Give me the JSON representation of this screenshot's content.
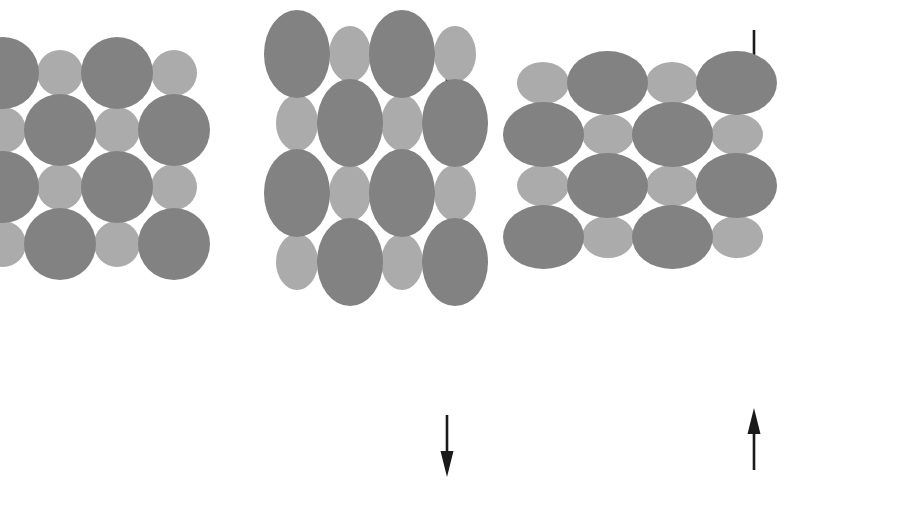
{
  "figure": {
    "width": 916,
    "height": 510,
    "background_color": "#ffffff",
    "description": "Three square arrays of alternating large dark grey and small light grey spheres. The left array is undeformed. The middle array is elongated vertically by a pair of outward arrows. The right array is flattened vertically by a pair of inward arrows."
  },
  "colors": {
    "large_particle": "#828282",
    "small_particle": "#ababab",
    "arrow": "#1a1a1a",
    "background": "#ffffff"
  },
  "geometry": {
    "large_radius": 36,
    "small_radius": 23,
    "step_x": 57,
    "step_y": 57,
    "columns": 4,
    "rows": 4
  },
  "panels": [
    {
      "id": "panel-unstressed",
      "name": "unstressed-lattice",
      "label": "Unstressed lattice",
      "origin_x": 88,
      "origin_y": 158,
      "scale_x": 1.0,
      "scale_y": 1.0,
      "parity": 0,
      "arrows": []
    },
    {
      "id": "panel-tension",
      "name": "tension-lattice",
      "label": "Lattice in tension",
      "origin_x": 376,
      "origin_y": 158,
      "scale_x": 0.92,
      "scale_y": 1.22,
      "parity": 0,
      "arrows": [
        {
          "name": "tension-arrow-top",
          "direction": "up",
          "x": 447,
          "y": 33,
          "length": 62,
          "label": "Tensile load, upward"
        },
        {
          "name": "tension-arrow-bottom",
          "direction": "down",
          "x": 447,
          "y": 415,
          "length": 62,
          "label": "Tensile load, downward"
        }
      ]
    },
    {
      "id": "panel-compression",
      "name": "compression-lattice",
      "label": "Lattice in compression",
      "origin_x": 640,
      "origin_y": 160,
      "scale_x": 1.13,
      "scale_y": 0.9,
      "parity": 1,
      "arrows": [
        {
          "name": "compression-arrow-top",
          "direction": "down",
          "x": 754,
          "y": 30,
          "length": 62,
          "label": "Compressive load, downward"
        },
        {
          "name": "compression-arrow-bottom",
          "direction": "up",
          "x": 754,
          "y": 408,
          "length": 62,
          "label": "Compressive load, upward"
        }
      ]
    }
  ],
  "legend": {
    "large_particle_label": "Large dark sphere",
    "small_particle_label": "Small light sphere"
  }
}
